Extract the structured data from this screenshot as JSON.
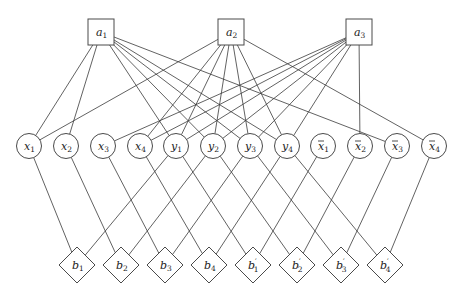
{
  "diagram": {
    "title": "",
    "colors": {
      "stroke": "#3a3a3a",
      "fill": "#ffffff",
      "text": "#222222"
    },
    "nodes": [
      {
        "id": "a1",
        "shape": "square",
        "x": 101,
        "y": 32,
        "base": "a",
        "sub": "1",
        "bar": false,
        "prime": false
      },
      {
        "id": "a2",
        "shape": "square",
        "x": 231,
        "y": 32,
        "base": "a",
        "sub": "2",
        "bar": false,
        "prime": false
      },
      {
        "id": "a3",
        "shape": "square",
        "x": 359,
        "y": 32,
        "base": "a",
        "sub": "3",
        "bar": false,
        "prime": false
      },
      {
        "id": "x1",
        "shape": "circle",
        "x": 29,
        "y": 146,
        "base": "x",
        "sub": "1",
        "bar": false,
        "prime": false
      },
      {
        "id": "x2",
        "shape": "circle",
        "x": 66,
        "y": 146,
        "base": "x",
        "sub": "2",
        "bar": false,
        "prime": false
      },
      {
        "id": "x3",
        "shape": "circle",
        "x": 103,
        "y": 146,
        "base": "x",
        "sub": "3",
        "bar": false,
        "prime": false
      },
      {
        "id": "x4",
        "shape": "circle",
        "x": 140,
        "y": 146,
        "base": "x",
        "sub": "4",
        "bar": false,
        "prime": false
      },
      {
        "id": "y1",
        "shape": "circle",
        "x": 176,
        "y": 146,
        "base": "y",
        "sub": "1",
        "bar": false,
        "prime": false
      },
      {
        "id": "y2",
        "shape": "circle",
        "x": 213,
        "y": 146,
        "base": "y",
        "sub": "2",
        "bar": false,
        "prime": false
      },
      {
        "id": "y3",
        "shape": "circle",
        "x": 250,
        "y": 146,
        "base": "y",
        "sub": "3",
        "bar": false,
        "prime": false
      },
      {
        "id": "y4",
        "shape": "circle",
        "x": 287,
        "y": 146,
        "base": "y",
        "sub": "4",
        "bar": false,
        "prime": false
      },
      {
        "id": "nx1",
        "shape": "circle",
        "x": 323,
        "y": 146,
        "base": "x",
        "sub": "1",
        "bar": true,
        "prime": false
      },
      {
        "id": "nx2",
        "shape": "circle",
        "x": 360,
        "y": 146,
        "base": "x",
        "sub": "2",
        "bar": true,
        "prime": false
      },
      {
        "id": "nx3",
        "shape": "circle",
        "x": 397,
        "y": 146,
        "base": "x",
        "sub": "3",
        "bar": true,
        "prime": false
      },
      {
        "id": "nx4",
        "shape": "circle",
        "x": 434,
        "y": 146,
        "base": "x",
        "sub": "4",
        "bar": true,
        "prime": false
      },
      {
        "id": "b1",
        "shape": "diamond",
        "x": 77,
        "y": 265,
        "base": "b",
        "sub": "1",
        "bar": false,
        "prime": false
      },
      {
        "id": "b2",
        "shape": "diamond",
        "x": 121,
        "y": 265,
        "base": "b",
        "sub": "2",
        "bar": false,
        "prime": false
      },
      {
        "id": "b3",
        "shape": "diamond",
        "x": 165,
        "y": 265,
        "base": "b",
        "sub": "3",
        "bar": false,
        "prime": false
      },
      {
        "id": "b4",
        "shape": "diamond",
        "x": 209,
        "y": 265,
        "base": "b",
        "sub": "4",
        "bar": false,
        "prime": false
      },
      {
        "id": "bp1",
        "shape": "diamond",
        "x": 253,
        "y": 265,
        "base": "b",
        "sub": "1",
        "bar": false,
        "prime": true
      },
      {
        "id": "bp2",
        "shape": "diamond",
        "x": 297,
        "y": 265,
        "base": "b",
        "sub": "2",
        "bar": false,
        "prime": true
      },
      {
        "id": "bp3",
        "shape": "diamond",
        "x": 341,
        "y": 265,
        "base": "b",
        "sub": "3",
        "bar": false,
        "prime": true
      },
      {
        "id": "bp4",
        "shape": "diamond",
        "x": 385,
        "y": 265,
        "base": "b",
        "sub": "4",
        "bar": false,
        "prime": true
      }
    ],
    "edges": [
      [
        "a1",
        "x1"
      ],
      [
        "a1",
        "x2"
      ],
      [
        "a1",
        "y1"
      ],
      [
        "a1",
        "y2"
      ],
      [
        "a1",
        "y3"
      ],
      [
        "a1",
        "y4"
      ],
      [
        "a1",
        "nx3"
      ],
      [
        "a2",
        "x1"
      ],
      [
        "a2",
        "x4"
      ],
      [
        "a2",
        "y1"
      ],
      [
        "a2",
        "y2"
      ],
      [
        "a2",
        "y3"
      ],
      [
        "a2",
        "y4"
      ],
      [
        "a2",
        "nx4"
      ],
      [
        "a3",
        "x3"
      ],
      [
        "a3",
        "x4"
      ],
      [
        "a3",
        "y1"
      ],
      [
        "a3",
        "y2"
      ],
      [
        "a3",
        "y3"
      ],
      [
        "a3",
        "y4"
      ],
      [
        "a3",
        "nx2"
      ],
      [
        "x1",
        "b1"
      ],
      [
        "y1",
        "b1"
      ],
      [
        "y1",
        "bp1"
      ],
      [
        "nx1",
        "bp1"
      ],
      [
        "x2",
        "b2"
      ],
      [
        "y2",
        "b2"
      ],
      [
        "y2",
        "bp2"
      ],
      [
        "nx2",
        "bp2"
      ],
      [
        "x3",
        "b3"
      ],
      [
        "y3",
        "b3"
      ],
      [
        "y3",
        "bp3"
      ],
      [
        "nx3",
        "bp3"
      ],
      [
        "x4",
        "b4"
      ],
      [
        "y4",
        "b4"
      ],
      [
        "y4",
        "bp4"
      ],
      [
        "nx4",
        "bp4"
      ]
    ]
  }
}
